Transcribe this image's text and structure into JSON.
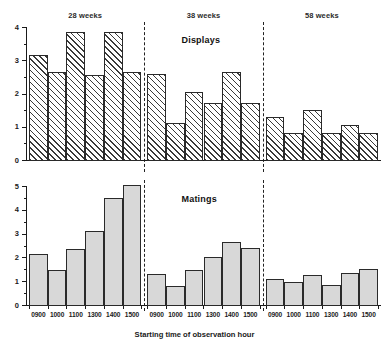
{
  "chart_data": {
    "type": "bar",
    "title": "",
    "xlabel": "Starting time of observation hour",
    "grid": false,
    "legend": "none",
    "group_labels": [
      "28 weeks",
      "38 weeks",
      "58 weeks"
    ],
    "categories": [
      "0900",
      "1000",
      "1100",
      "1300",
      "1400",
      "1500"
    ],
    "panels": [
      {
        "name": "Displays",
        "ylabel": "",
        "ylim": [
          0,
          4
        ],
        "yticks": [
          0,
          1,
          2,
          3,
          4
        ],
        "ytick_labels": [
          "0",
          "1",
          "2",
          "3",
          "4"
        ],
        "bar_style": "hatched",
        "groups": [
          {
            "label": "28 weeks",
            "categories": [
              "0900",
              "1000",
              "1100",
              "1300",
              "1400",
              "1500"
            ],
            "values": [
              3.15,
              2.65,
              3.85,
              2.55,
              3.85,
              2.65
            ]
          },
          {
            "label": "38 weeks",
            "categories": [
              "0900",
              "1000",
              "1100",
              "1300",
              "1400",
              "1500"
            ],
            "values": [
              2.6,
              1.1,
              2.05,
              1.7,
              2.65,
              1.7
            ]
          },
          {
            "label": "58 weeks",
            "categories": [
              "0900",
              "1000",
              "1100",
              "1300",
              "1400",
              "1500"
            ],
            "values": [
              1.3,
              0.8,
              1.5,
              0.8,
              1.05,
              0.8
            ]
          }
        ]
      },
      {
        "name": "Matings",
        "ylabel": "",
        "ylim": [
          0,
          5
        ],
        "yticks": [
          0,
          1,
          2,
          3,
          4,
          5
        ],
        "ytick_labels": [
          "0",
          "1",
          "2",
          "3",
          "4",
          "5"
        ],
        "bar_style": "solid-grey",
        "groups": [
          {
            "label": "28 weeks",
            "categories": [
              "0900",
              "1000",
              "1100",
              "1300",
              "1400",
              "1500"
            ],
            "values": [
              2.15,
              1.45,
              2.35,
              3.1,
              4.5,
              5.05
            ]
          },
          {
            "label": "38 weeks",
            "categories": [
              "0900",
              "1000",
              "1100",
              "1300",
              "1400",
              "1500"
            ],
            "values": [
              1.3,
              0.8,
              1.45,
              2.0,
              2.65,
              2.4
            ]
          },
          {
            "label": "58 weeks",
            "categories": [
              "0900",
              "1000",
              "1100",
              "1300",
              "1400",
              "1500"
            ],
            "values": [
              1.1,
              0.95,
              1.25,
              0.85,
              1.35,
              1.5
            ]
          }
        ]
      }
    ],
    "colors": {
      "axis": "#1a1a1a",
      "bar_outline": "#2a2a2a",
      "bar_hatch": "#3a3a3a",
      "bar_fill_solid": "#d8d8d8",
      "divider": "#222222",
      "background": "#ffffff"
    }
  }
}
